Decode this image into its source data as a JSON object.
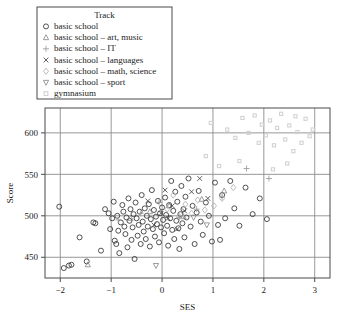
{
  "chart_data": {
    "type": "scatter",
    "title": "",
    "xlabel": "SES",
    "ylabel": "Score",
    "xlim": [
      -2.3,
      3.3
    ],
    "ylim": [
      425,
      630
    ],
    "xticks": [
      -2,
      -1,
      0,
      1,
      2,
      3
    ],
    "xtick_labels": [
      "−2",
      "−1",
      "0",
      "1",
      "2",
      "3"
    ],
    "yticks": [
      450,
      500,
      550,
      600
    ],
    "ytick_labels": [
      "450",
      "500",
      "550",
      "600"
    ],
    "grid": true,
    "grid_on_ticks": true,
    "legend": {
      "title": "Track",
      "position": "top-left-outside",
      "entries": [
        {
          "label": "basic school",
          "marker": "circle",
          "color": "#333333"
        },
        {
          "label": "basic school – art, music",
          "marker": "triangle-up",
          "color": "#8a8a8a"
        },
        {
          "label": "basic school – IT",
          "marker": "plus",
          "color": "#9a9a9a"
        },
        {
          "label": "basic school – languages",
          "marker": "cross",
          "color": "#444444"
        },
        {
          "label": "basic school – math, science",
          "marker": "diamond",
          "color": "#b0b0b0"
        },
        {
          "label": "basic school – sport",
          "marker": "triangle-down",
          "color": "#8a8a8a"
        },
        {
          "label": "gymnasium",
          "marker": "square-dotted",
          "color": "#d2d2d2"
        }
      ]
    },
    "series": [
      {
        "name": "basic school",
        "marker": "circle",
        "color": "#333333",
        "points": [
          [
            -2.02,
            511
          ],
          [
            -1.93,
            437
          ],
          [
            -1.83,
            440
          ],
          [
            -1.78,
            441
          ],
          [
            -1.62,
            474
          ],
          [
            -1.48,
            445
          ],
          [
            -1.35,
            492
          ],
          [
            -1.31,
            491
          ],
          [
            -1.2,
            458
          ],
          [
            -1.12,
            508
          ],
          [
            -1.05,
            503
          ],
          [
            -1.02,
            484
          ],
          [
            -0.98,
            497
          ],
          [
            -0.95,
            517
          ],
          [
            -0.93,
            470
          ],
          [
            -0.9,
            466
          ],
          [
            -0.88,
            500
          ],
          [
            -0.86,
            482
          ],
          [
            -0.84,
            455
          ],
          [
            -0.81,
            492
          ],
          [
            -0.78,
            513
          ],
          [
            -0.76,
            505
          ],
          [
            -0.74,
            487
          ],
          [
            -0.72,
            478
          ],
          [
            -0.7,
            498
          ],
          [
            -0.68,
            462
          ],
          [
            -0.66,
            521
          ],
          [
            -0.64,
            494
          ],
          [
            -0.62,
            508
          ],
          [
            -0.6,
            471
          ],
          [
            -0.58,
            486
          ],
          [
            -0.56,
            502
          ],
          [
            -0.54,
            448
          ],
          [
            -0.52,
            516
          ],
          [
            -0.5,
            497
          ],
          [
            -0.48,
            476
          ],
          [
            -0.46,
            489
          ],
          [
            -0.44,
            505
          ],
          [
            -0.42,
            466
          ],
          [
            -0.4,
            525
          ],
          [
            -0.38,
            493
          ],
          [
            -0.36,
            481
          ],
          [
            -0.34,
            509
          ],
          [
            -0.32,
            472
          ],
          [
            -0.3,
            500
          ],
          [
            -0.28,
            487
          ],
          [
            -0.26,
            514
          ],
          [
            -0.24,
            463
          ],
          [
            -0.22,
            496
          ],
          [
            -0.2,
            531
          ],
          [
            -0.18,
            484
          ],
          [
            -0.16,
            507
          ],
          [
            -0.14,
            475
          ],
          [
            -0.12,
            499
          ],
          [
            -0.1,
            490
          ],
          [
            -0.08,
            518
          ],
          [
            -0.06,
            468
          ],
          [
            -0.04,
            503
          ],
          [
            -0.02,
            486
          ],
          [
            0.0,
            510
          ],
          [
            0.02,
            495
          ],
          [
            0.04,
            479
          ],
          [
            0.06,
            522
          ],
          [
            0.08,
            501
          ],
          [
            0.1,
            488
          ],
          [
            0.12,
            464
          ],
          [
            0.14,
            513
          ],
          [
            0.16,
            497
          ],
          [
            0.18,
            542
          ],
          [
            0.2,
            483
          ],
          [
            0.22,
            506
          ],
          [
            0.24,
            472
          ],
          [
            0.26,
            529
          ],
          [
            0.28,
            494
          ],
          [
            0.3,
            517
          ],
          [
            0.32,
            485
          ],
          [
            0.34,
            460
          ],
          [
            0.36,
            502
          ],
          [
            0.38,
            536
          ],
          [
            0.4,
            491
          ],
          [
            0.42,
            508
          ],
          [
            0.44,
            474
          ],
          [
            0.46,
            523
          ],
          [
            0.48,
            498
          ],
          [
            0.52,
            545
          ],
          [
            0.56,
            487
          ],
          [
            0.6,
            512
          ],
          [
            0.64,
            466
          ],
          [
            0.68,
            504
          ],
          [
            0.72,
            530
          ],
          [
            0.76,
            493
          ],
          [
            0.8,
            477
          ],
          [
            0.86,
            516
          ],
          [
            0.92,
            500
          ],
          [
            0.98,
            469
          ],
          [
            1.04,
            540
          ],
          [
            1.1,
            489
          ],
          [
            1.14,
            471
          ],
          [
            1.18,
            525
          ],
          [
            1.24,
            497
          ],
          [
            1.34,
            542
          ],
          [
            1.42,
            509
          ],
          [
            1.52,
            488
          ],
          [
            1.64,
            534
          ],
          [
            1.78,
            502
          ],
          [
            1.92,
            521
          ],
          [
            2.06,
            496
          ]
        ]
      },
      {
        "name": "basic school – art, music",
        "marker": "triangle-up",
        "color": "#8a8a8a",
        "points": [
          [
            -1.46,
            441
          ],
          [
            -0.62,
            497
          ],
          [
            -0.24,
            505
          ],
          [
            0.14,
            512
          ],
          [
            0.42,
            499
          ],
          [
            0.78,
            520
          ],
          [
            1.22,
            530
          ]
        ]
      },
      {
        "name": "basic school – IT",
        "marker": "plus",
        "color": "#9a9a9a",
        "points": [
          [
            -0.86,
            495
          ],
          [
            -0.42,
            503
          ],
          [
            -0.06,
            516
          ],
          [
            0.34,
            498
          ],
          [
            0.68,
            508
          ],
          [
            1.18,
            523
          ],
          [
            1.66,
            557
          ],
          [
            2.1,
            545
          ]
        ]
      },
      {
        "name": "basic school – languages",
        "marker": "cross",
        "color": "#444444",
        "points": [
          [
            -0.28,
            518
          ],
          [
            -0.16,
            489
          ],
          [
            -0.02,
            503
          ],
          [
            0.06,
            531
          ],
          [
            0.12,
            497
          ],
          [
            0.2,
            512
          ],
          [
            0.3,
            484
          ],
          [
            0.44,
            506
          ],
          [
            0.58,
            529
          ],
          [
            0.74,
            545
          ],
          [
            0.9,
            521
          ]
        ]
      },
      {
        "name": "basic school – math, science",
        "marker": "diamond",
        "color": "#b0b0b0",
        "points": [
          [
            0.1,
            508
          ],
          [
            0.22,
            525
          ],
          [
            0.34,
            499
          ],
          [
            0.46,
            514
          ],
          [
            0.58,
            503
          ],
          [
            0.7,
            519
          ],
          [
            0.84,
            507
          ],
          [
            1.02,
            512
          ],
          [
            1.18,
            521
          ],
          [
            1.4,
            534
          ]
        ]
      },
      {
        "name": "basic school – sport",
        "marker": "triangle-down",
        "color": "#8a8a8a",
        "points": [
          [
            -0.12,
            440
          ],
          [
            0.62,
            498
          ],
          [
            0.88,
            489
          ]
        ]
      },
      {
        "name": "gymnasium",
        "marker": "square-dotted",
        "color": "#d2d2d2",
        "points": [
          [
            0.96,
            612
          ],
          [
            1.28,
            604
          ],
          [
            1.44,
            594
          ],
          [
            1.58,
            618
          ],
          [
            1.7,
            600
          ],
          [
            1.82,
            621
          ],
          [
            1.9,
            588
          ],
          [
            1.96,
            610
          ],
          [
            2.04,
            597
          ],
          [
            2.12,
            615
          ],
          [
            2.2,
            585
          ],
          [
            2.26,
            606
          ],
          [
            2.34,
            623
          ],
          [
            2.42,
            592
          ],
          [
            2.5,
            609
          ],
          [
            2.58,
            578
          ],
          [
            2.66,
            601
          ],
          [
            2.74,
            588
          ],
          [
            2.82,
            617
          ],
          [
            2.9,
            596
          ],
          [
            2.18,
            556
          ],
          [
            2.46,
            563
          ],
          [
            1.52,
            566
          ],
          [
            0.86,
            572
          ],
          [
            1.12,
            560
          ],
          [
            2.62,
            620
          ],
          [
            2.96,
            604
          ]
        ]
      }
    ]
  }
}
